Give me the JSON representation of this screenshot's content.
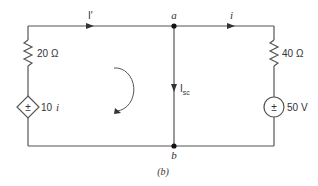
{
  "figure": {
    "caption": "(b)",
    "nodes": {
      "a": {
        "label": "a"
      },
      "b": {
        "label": "b"
      }
    },
    "components": {
      "resistor_left": {
        "label": "20 Ω",
        "value": "20",
        "unit": "Ω"
      },
      "dependent_source": {
        "label": "10 i",
        "coefficient": "10",
        "variable": "i",
        "symbol": "±"
      },
      "resistor_right": {
        "label": "40 Ω",
        "value": "40",
        "unit": "Ω"
      },
      "voltage_source": {
        "label": "50 V",
        "value": "50",
        "unit": "V",
        "symbol": "±"
      }
    },
    "currents": {
      "i_prime": {
        "label": "I′"
      },
      "i": {
        "label": "i"
      },
      "isc": {
        "main": "I",
        "subscript": "sc"
      }
    },
    "mesh_arrow": {
      "direction": "clockwise"
    },
    "colors": {
      "wire": "#555555",
      "text": "#333333",
      "background": "#ffffff"
    }
  }
}
